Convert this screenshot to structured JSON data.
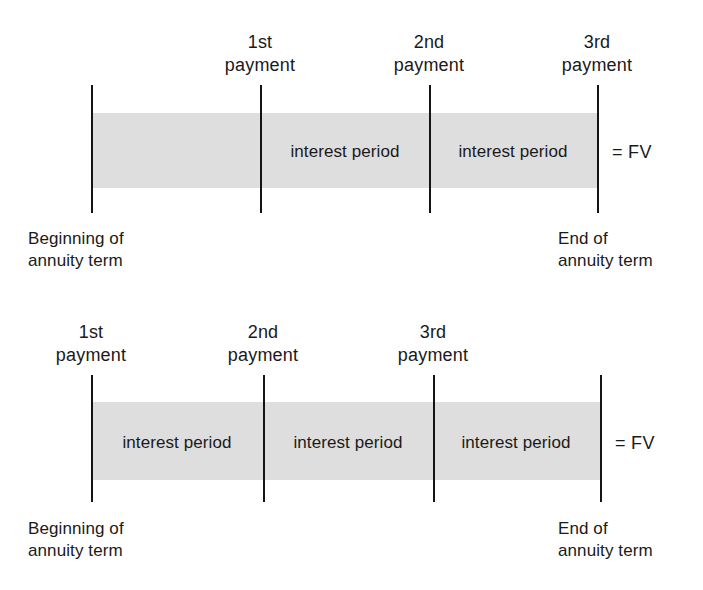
{
  "figures": [
    {
      "id": "ordinary-annuity",
      "name": "ordinary-annuity-timeline",
      "band": {
        "color": "#dedede",
        "left": 91,
        "top": 113,
        "width": 506,
        "height": 75
      },
      "ticks": [
        {
          "name": "timeline-start-tick",
          "x": 91,
          "top": 85,
          "height": 128
        },
        {
          "name": "payment-1-tick",
          "x": 260,
          "top": 85,
          "height": 128
        },
        {
          "name": "payment-2-tick",
          "x": 429,
          "top": 85,
          "height": 128
        },
        {
          "name": "payment-3-tick",
          "x": 597,
          "top": 85,
          "height": 128
        }
      ],
      "payment_labels": [
        {
          "name": "payment-label-1",
          "ordinal": "1st",
          "word": "payment",
          "x": 260,
          "top": 31
        },
        {
          "name": "payment-label-2",
          "ordinal": "2nd",
          "word": "payment",
          "x": 429,
          "top": 31
        },
        {
          "name": "payment-label-3",
          "ordinal": "3rd",
          "word": "payment",
          "x": 597,
          "top": 31
        }
      ],
      "interest_labels": [
        {
          "name": "interest-period-label-1",
          "text": "interest period",
          "x": 345,
          "y": 152
        },
        {
          "name": "interest-period-label-2",
          "text": "interest period",
          "x": 513,
          "y": 152
        }
      ],
      "fv_label": {
        "name": "future-value-label",
        "text": "= FV",
        "x": 612,
        "y": 152
      },
      "endpoints": [
        {
          "name": "beginning-of-term-label",
          "line1": "Beginning of",
          "line2": "annuity term",
          "x": 28,
          "top": 228
        },
        {
          "name": "end-of-term-label",
          "line1": "End of",
          "line2": "annuity term",
          "x": 558,
          "top": 228
        }
      ]
    },
    {
      "id": "annuity-due",
      "name": "annuity-due-timeline",
      "band": {
        "color": "#dedede",
        "left": 91,
        "top": 112,
        "width": 509,
        "height": 78
      },
      "ticks": [
        {
          "name": "payment-1-tick",
          "x": 91,
          "top": 85,
          "height": 127
        },
        {
          "name": "payment-2-tick",
          "x": 263,
          "top": 85,
          "height": 127
        },
        {
          "name": "payment-3-tick",
          "x": 433,
          "top": 85,
          "height": 127
        },
        {
          "name": "timeline-end-tick",
          "x": 600,
          "top": 85,
          "height": 127
        }
      ],
      "payment_labels": [
        {
          "name": "payment-label-1",
          "ordinal": "1st",
          "word": "payment",
          "x": 91,
          "top": 31
        },
        {
          "name": "payment-label-2",
          "ordinal": "2nd",
          "word": "payment",
          "x": 263,
          "top": 31
        },
        {
          "name": "payment-label-3",
          "ordinal": "3rd",
          "word": "payment",
          "x": 433,
          "top": 31
        }
      ],
      "interest_labels": [
        {
          "name": "interest-period-label-1",
          "text": "interest period",
          "x": 177,
          "y": 153
        },
        {
          "name": "interest-period-label-2",
          "text": "interest period",
          "x": 348,
          "y": 153
        },
        {
          "name": "interest-period-label-3",
          "text": "interest period",
          "x": 516,
          "y": 153
        }
      ],
      "fv_label": {
        "name": "future-value-label",
        "text": "= FV",
        "x": 615,
        "y": 153
      },
      "endpoints": [
        {
          "name": "beginning-of-term-label",
          "line1": "Beginning of",
          "line2": "annuity term",
          "x": 28,
          "top": 228
        },
        {
          "name": "end-of-term-label",
          "line1": "End of",
          "line2": "annuity term",
          "x": 558,
          "top": 228
        }
      ]
    }
  ]
}
